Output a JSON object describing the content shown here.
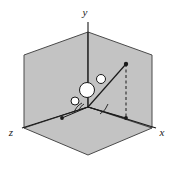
{
  "figure": {
    "background_color": "#ffffff",
    "plane_fill": "#c3c3c3",
    "plane_stroke": "#4a4a4a",
    "line_color": "#1a1a1a",
    "circle_fill": "#ffffff",
    "circle_stroke": "#1a1a1a"
  },
  "axes": [
    {
      "name": "y-axis",
      "label": "y",
      "label_x": 88,
      "label_y": 12,
      "from": [
        88,
        107
      ],
      "to": [
        88,
        22
      ]
    },
    {
      "name": "z-axis",
      "label": "z",
      "label_x": 12,
      "label_y": 133,
      "from": [
        88,
        107
      ],
      "to": [
        22,
        128
      ]
    },
    {
      "name": "x-axis",
      "label": "x",
      "label_x": 160,
      "label_y": 133,
      "from": [
        88,
        107
      ],
      "to": [
        156,
        128
      ]
    }
  ],
  "planes": [
    {
      "name": "yz-plane",
      "points": "24,55 88,32 88,107 24,128"
    },
    {
      "name": "xy-plane",
      "points": "88,32 152,55 152,128 88,107"
    },
    {
      "name": "xz-plane",
      "points": "24,128 88,107 152,128 88,155"
    }
  ],
  "vector": {
    "name": "position-vector",
    "from": [
      88,
      107
    ],
    "to": [
      126,
      64
    ],
    "tip_dot_radius": 2.2
  },
  "projection": {
    "name": "xz-projection",
    "from": [
      88,
      107
    ],
    "to": [
      126,
      118
    ],
    "dot_radius": 2.0,
    "dashed_vertical_from": [
      126,
      64
    ],
    "dashed_vertical_to": [
      126,
      118
    ]
  },
  "secondary_segment": {
    "name": "left-projection-segment",
    "from": [
      88,
      107
    ],
    "to": [
      62,
      118
    ],
    "dot_radius": 2.0
  },
  "circles": [
    {
      "name": "center-node",
      "cx": 87,
      "cy": 90,
      "r": 7.5
    },
    {
      "name": "upper-right-node",
      "cx": 101,
      "cy": 79,
      "r": 4.5
    },
    {
      "name": "lower-left-node",
      "cx": 75,
      "cy": 101,
      "r": 4.0
    }
  ],
  "angle_arcs": [
    {
      "name": "azimuth-arc",
      "d": "M 74,113 A 16,16 0 0 1 82,103"
    },
    {
      "name": "polar-arc",
      "d": "M 100,114 A 18,18 0 0 0 108,104"
    },
    {
      "name": "inner-arc",
      "d": "M 79,110 A 11,11 0 0 1 84,104"
    }
  ]
}
